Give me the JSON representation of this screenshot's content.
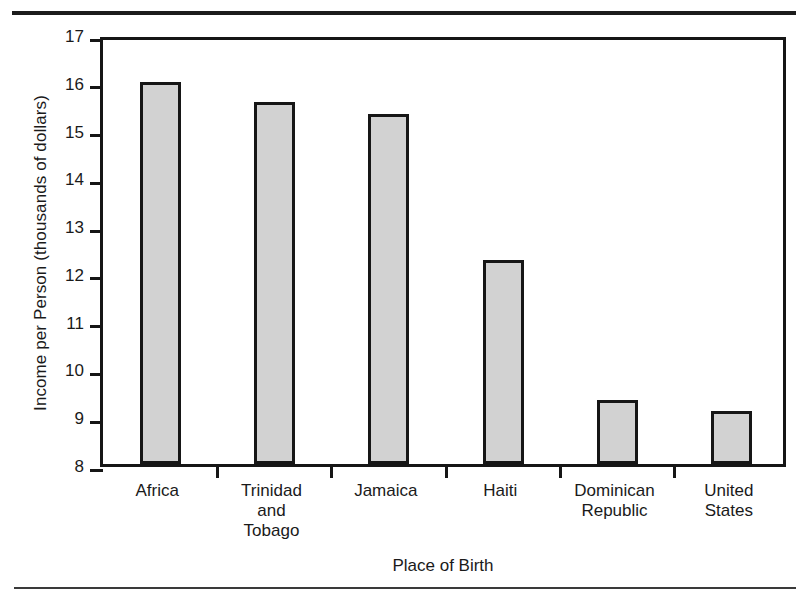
{
  "figure": {
    "background_color": "#ffffff",
    "ink_color": "#161616",
    "bar_fill_color": "#d2d2d2",
    "bar_border_color": "#161616"
  },
  "rules": {
    "top_rule_name": "top-page-rule",
    "bottom_rule_name": "bottom-page-rule"
  },
  "chart_data": {
    "type": "bar",
    "title": "",
    "xlabel": "Place of Birth",
    "ylabel": "Income per Person (thousands of dollars)",
    "categories": [
      "Africa",
      "Trinidad and Tobago",
      "Jamaica",
      "Haiti",
      "Dominican Republic",
      "United States"
    ],
    "category_label_lines": [
      [
        "Africa"
      ],
      [
        "Trinidad",
        "and",
        "Tobago"
      ],
      [
        "Jamaica"
      ],
      [
        "Haiti"
      ],
      [
        "Dominican",
        "Republic"
      ],
      [
        "United",
        "States"
      ]
    ],
    "values": [
      16.0,
      15.58,
      15.32,
      12.28,
      9.35,
      9.1
    ],
    "ylim": [
      8,
      17
    ],
    "yticks": [
      8,
      9,
      10,
      11,
      12,
      13,
      14,
      15,
      16,
      17
    ],
    "ytick_labels": [
      "8",
      "9",
      "10",
      "11",
      "12",
      "13",
      "14",
      "15",
      "16",
      "17"
    ],
    "grid": false,
    "legend": null,
    "legend_position": "none"
  }
}
